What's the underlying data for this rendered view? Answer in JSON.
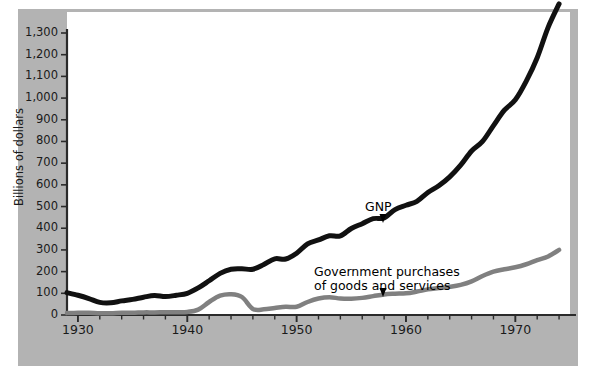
{
  "figure": {
    "background_color": "#b3b3b3",
    "plot_background_color": "#ffffff",
    "axis_color": "#2b2b2b"
  },
  "axis": {
    "ylabel": "Billions of dollars",
    "yticks": [
      "0",
      "100",
      "200",
      "300",
      "400",
      "500",
      "600",
      "700",
      "800",
      "900",
      "1,000",
      "1,100",
      "1,200",
      "1,300"
    ],
    "xticks_labeled": [
      "1930",
      "1940",
      "1950",
      "1960",
      "1970"
    ]
  },
  "annotations": {
    "gnp": "GNP",
    "gov_line1": "Government purchases",
    "gov_line2": "of goods and services"
  },
  "chart_data": {
    "type": "line",
    "title": "",
    "xlabel": "",
    "ylabel": "Billions of dollars",
    "xlim": [
      1929,
      1975
    ],
    "ylim": [
      0,
      1350
    ],
    "yticks": [
      0,
      100,
      200,
      300,
      400,
      500,
      600,
      700,
      800,
      900,
      1000,
      1100,
      1200,
      1300
    ],
    "xticks_major": [
      1930,
      1940,
      1950,
      1960,
      1970
    ],
    "xtick_minor_step": 2,
    "grid": false,
    "legend": "inline-annotations",
    "x": [
      1929,
      1930,
      1931,
      1932,
      1933,
      1934,
      1935,
      1936,
      1937,
      1938,
      1939,
      1940,
      1941,
      1942,
      1943,
      1944,
      1945,
      1946,
      1947,
      1948,
      1949,
      1950,
      1951,
      1952,
      1953,
      1954,
      1955,
      1956,
      1957,
      1958,
      1959,
      1960,
      1961,
      1962,
      1963,
      1964,
      1965,
      1966,
      1967,
      1968,
      1969,
      1970,
      1971,
      1972,
      1973,
      1974
    ],
    "series": [
      {
        "name": "GNP",
        "color": "#111111",
        "width": 5,
        "values": [
          103,
          91,
          76,
          58,
          56,
          65,
          72,
          82,
          90,
          85,
          91,
          100,
          125,
          158,
          192,
          211,
          213,
          211,
          233,
          259,
          258,
          285,
          328,
          346,
          365,
          365,
          399,
          421,
          444,
          448,
          486,
          506,
          524,
          565,
          596,
          637,
          691,
          756,
          800,
          873,
          944,
          992,
          1078,
          1186,
          1326,
          1434
        ]
      },
      {
        "name": "Government purchases of goods and services",
        "color": "#808080",
        "width": 4.5,
        "values": [
          9,
          10,
          10,
          8,
          8,
          10,
          10,
          12,
          12,
          13,
          13,
          14,
          25,
          60,
          89,
          96,
          83,
          28,
          26,
          32,
          38,
          38,
          60,
          76,
          82,
          76,
          75,
          79,
          87,
          95,
          98,
          100,
          108,
          118,
          124,
          130,
          139,
          155,
          180,
          200,
          211,
          220,
          234,
          253,
          270,
          300
        ]
      }
    ]
  }
}
